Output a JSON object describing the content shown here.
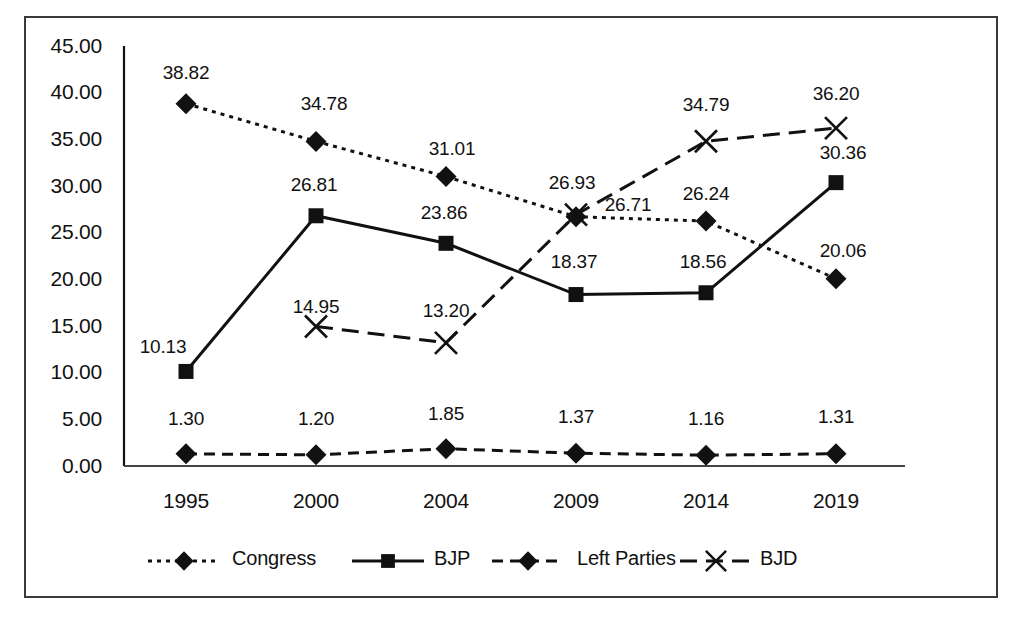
{
  "chart_data": {
    "type": "line",
    "title": "",
    "xlabel": "",
    "ylabel": "",
    "categories": [
      "1995",
      "2000",
      "2004",
      "2009",
      "2014",
      "2019"
    ],
    "ylim": [
      0,
      45
    ],
    "yticks": [
      "0.00",
      "5.00",
      "10.00",
      "15.00",
      "20.00",
      "25.00",
      "30.00",
      "35.00",
      "40.00",
      "45.00"
    ],
    "ytick_values": [
      0,
      5,
      10,
      15,
      20,
      25,
      30,
      35,
      40,
      45
    ],
    "grid": false,
    "legend_position": "bottom",
    "series": [
      {
        "name": "Congress",
        "marker": "diamond",
        "line_style": "dotted",
        "values": [
          38.82,
          34.78,
          31.01,
          26.71,
          26.24,
          20.06
        ],
        "labels": [
          "38.82",
          "34.78",
          "31.01",
          "26.71",
          "26.24",
          "20.06"
        ]
      },
      {
        "name": "BJP",
        "marker": "square",
        "line_style": "solid",
        "values": [
          10.13,
          26.81,
          23.86,
          18.37,
          18.56,
          30.36
        ],
        "labels": [
          "10.13",
          "26.81",
          "23.86",
          "18.37",
          "18.56",
          "30.36"
        ]
      },
      {
        "name": "Left Parties",
        "marker": "diamond",
        "line_style": "dashed",
        "values": [
          1.3,
          1.2,
          1.85,
          1.37,
          1.16,
          1.31
        ],
        "labels": [
          "1.30",
          "1.20",
          "1.85",
          "1.37",
          "1.16",
          "1.31"
        ]
      },
      {
        "name": "BJD",
        "marker": "cross",
        "line_style": "long-dash",
        "values": [
          null,
          14.95,
          13.2,
          26.93,
          34.79,
          36.2
        ],
        "labels": [
          null,
          "14.95",
          "13.20",
          "26.93",
          "34.79",
          "36.20"
        ]
      }
    ]
  },
  "axis": {
    "y_labels": [
      {
        "text": "45.00",
        "x": 36,
        "y": 34
      },
      {
        "text": "40.00",
        "x": 36,
        "y": 80
      },
      {
        "text": "35.00",
        "x": 36,
        "y": 127
      },
      {
        "text": "30.00",
        "x": 36,
        "y": 174
      },
      {
        "text": "25.00",
        "x": 36,
        "y": 220
      },
      {
        "text": "20.00",
        "x": 36,
        "y": 267
      },
      {
        "text": "15.00",
        "x": 36,
        "y": 314
      },
      {
        "text": "10.00",
        "x": 36,
        "y": 360
      },
      {
        "text": "5.00",
        "x": 36,
        "y": 407
      },
      {
        "text": "0.00",
        "x": 36,
        "y": 454
      }
    ],
    "x_labels": [
      {
        "text": "1995",
        "x": 186,
        "y": 489
      },
      {
        "text": "2000",
        "x": 316,
        "y": 489
      },
      {
        "text": "2004",
        "x": 446,
        "y": 489
      },
      {
        "text": "2009",
        "x": 576,
        "y": 489
      },
      {
        "text": "2014",
        "x": 706,
        "y": 489
      },
      {
        "text": "2019",
        "x": 836,
        "y": 489
      }
    ]
  },
  "point_labels": [
    {
      "text": "38.82",
      "x": 186,
      "y": 62
    },
    {
      "text": "34.78",
      "x": 324,
      "y": 93
    },
    {
      "text": "31.01",
      "x": 452,
      "y": 138
    },
    {
      "text": "26.93",
      "x": 572,
      "y": 172
    },
    {
      "text": "26.71",
      "x": 628,
      "y": 194
    },
    {
      "text": "26.24",
      "x": 706,
      "y": 183
    },
    {
      "text": "20.06",
      "x": 843,
      "y": 240
    },
    {
      "text": "10.13",
      "x": 163,
      "y": 336
    },
    {
      "text": "26.81",
      "x": 314,
      "y": 174
    },
    {
      "text": "23.86",
      "x": 444,
      "y": 202
    },
    {
      "text": "18.37",
      "x": 574,
      "y": 251
    },
    {
      "text": "18.56",
      "x": 703,
      "y": 251
    },
    {
      "text": "30.36",
      "x": 843,
      "y": 142
    },
    {
      "text": "1.30",
      "x": 186,
      "y": 408
    },
    {
      "text": "1.20",
      "x": 316,
      "y": 408
    },
    {
      "text": "1.85",
      "x": 446,
      "y": 403
    },
    {
      "text": "1.37",
      "x": 576,
      "y": 406
    },
    {
      "text": "1.16",
      "x": 706,
      "y": 408
    },
    {
      "text": "1.31",
      "x": 836,
      "y": 406
    },
    {
      "text": "14.95",
      "x": 316,
      "y": 296
    },
    {
      "text": "13.20",
      "x": 446,
      "y": 300
    },
    {
      "text": "34.79",
      "x": 706,
      "y": 94
    },
    {
      "text": "36.20",
      "x": 836,
      "y": 83
    }
  ],
  "legend": {
    "items": [
      {
        "label": "Congress",
        "marker": "diamond",
        "line_style": "dotted",
        "label_x": 232,
        "swatch_x": 148
      },
      {
        "label": "BJP",
        "marker": "square",
        "line_style": "solid",
        "label_x": 434,
        "swatch_x": 352
      },
      {
        "label": "Left Parties",
        "marker": "diamond",
        "line_style": "dashed",
        "label_x": 577,
        "swatch_x": 492
      },
      {
        "label": "BJD",
        "marker": "cross",
        "line_style": "long-dash",
        "label_x": 760,
        "swatch_x": 680
      }
    ]
  },
  "colors": {
    "ink": "#111111",
    "frame": "#3a3a3a",
    "background": "#ffffff"
  }
}
